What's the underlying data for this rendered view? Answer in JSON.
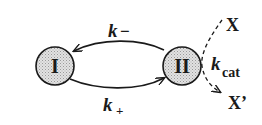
{
  "diagram": {
    "type": "kinetic-scheme",
    "states": [
      {
        "id": "I",
        "label": "I"
      },
      {
        "id": "II",
        "label": "II"
      }
    ],
    "transitions": [
      {
        "from": "II",
        "to": "I",
        "rate_symbol": "k",
        "rate_sub": "−",
        "style": "solid"
      },
      {
        "from": "I",
        "to": "II",
        "rate_symbol": "k",
        "rate_sub": "+",
        "style": "solid"
      },
      {
        "from": "X",
        "to": "X'",
        "via": "II",
        "rate_symbol": "k",
        "rate_sub": "cat",
        "style": "dashed"
      }
    ],
    "substrate": "X",
    "product": "X’"
  },
  "colors": {
    "node_fill": "#d4d4d4",
    "stroke": "#1a1a1a",
    "background": "#ffffff"
  }
}
